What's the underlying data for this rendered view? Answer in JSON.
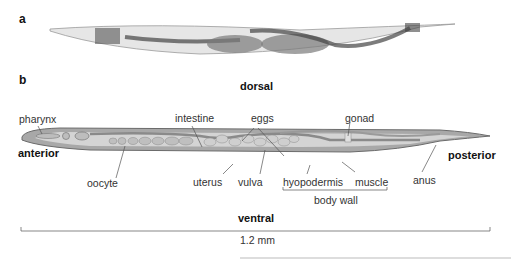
{
  "panels": {
    "a": {
      "letter": "a"
    },
    "b": {
      "letter": "b"
    }
  },
  "orientation": {
    "dorsal": "dorsal",
    "ventral": "ventral",
    "anterior": "anterior",
    "posterior": "posterior"
  },
  "labels": {
    "pharynx": "pharynx",
    "intestine": "intestine",
    "eggs": "eggs",
    "gonad": "gonad",
    "oocyte": "oocyte",
    "uterus": "uterus",
    "vulva": "vulva",
    "hyopodermis": "hyopodermis",
    "muscle": "muscle",
    "anus": "anus",
    "body_wall": "body wall"
  },
  "scale_bar": {
    "label": "1.2 mm"
  },
  "colors": {
    "body_fill": "#a9a9a9",
    "body_outline": "#6e6e6e",
    "interior": "#d9d9d9",
    "egg": "#c4c4c4",
    "line": "#555555"
  }
}
